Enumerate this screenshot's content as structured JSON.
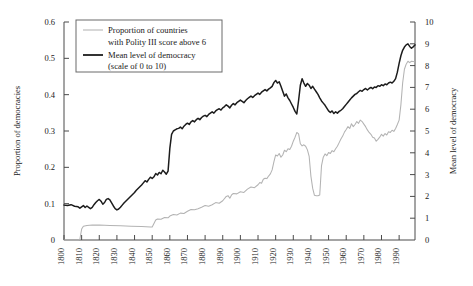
{
  "chart_data": {
    "type": "line",
    "title": "",
    "xlabel": "",
    "ylabel": "Proportion of democracies",
    "y2label": "Mean level of democracy",
    "grid": false,
    "legend_position": "top-left",
    "xlim": [
      1800,
      1999
    ],
    "ylim": [
      0,
      0.6
    ],
    "y2lim": [
      0,
      10
    ],
    "xticks": [
      1800,
      1810,
      1820,
      1830,
      1840,
      1850,
      1860,
      1870,
      1880,
      1890,
      1900,
      1910,
      1920,
      1930,
      1940,
      1950,
      1960,
      1970,
      1980,
      1990
    ],
    "xtick_labels": [
      "1800",
      "1810",
      "1820",
      "1830",
      "1840",
      "1850",
      "1860",
      "1870",
      "1880",
      "1890",
      "1900",
      "1910",
      "1920",
      "1930",
      "1940",
      "1950",
      "1960",
      "1970",
      "1980",
      "1990"
    ],
    "yticks": [
      0,
      0.1,
      0.2,
      0.3,
      0.4,
      0.5,
      0.6
    ],
    "ytick_labels": [
      "0",
      "0.1",
      "0.2",
      "0.3",
      "0.4",
      "0.5",
      "0.6"
    ],
    "y2ticks": [
      0,
      1,
      2,
      3,
      4,
      5,
      6,
      7,
      8,
      9,
      10
    ],
    "y2tick_labels": [
      "0",
      "1",
      "2",
      "3",
      "4",
      "5",
      "6",
      "7",
      "8",
      "9",
      "10"
    ],
    "series": [
      {
        "name": "Proportion of countries with Polity III score above 6",
        "axis": "left",
        "color": "#b3b3b3",
        "x": [
          1800,
          1802,
          1804,
          1806,
          1808,
          1809,
          1810,
          1811,
          1813,
          1816,
          1820,
          1824,
          1828,
          1832,
          1836,
          1840,
          1844,
          1848,
          1849,
          1850,
          1851,
          1852,
          1853,
          1854,
          1855,
          1856,
          1857,
          1858,
          1859,
          1860,
          1861,
          1862,
          1864,
          1866,
          1868,
          1870,
          1872,
          1874,
          1876,
          1878,
          1880,
          1882,
          1884,
          1886,
          1888,
          1890,
          1892,
          1894,
          1896,
          1898,
          1900,
          1902,
          1904,
          1906,
          1908,
          1910,
          1912,
          1914,
          1916,
          1918,
          1919,
          1920,
          1921,
          1922,
          1924,
          1926,
          1928,
          1930,
          1931,
          1932,
          1933,
          1934,
          1935,
          1936,
          1937,
          1938,
          1939,
          1940,
          1941,
          1942,
          1943,
          1944,
          1945,
          1946,
          1947,
          1948,
          1950,
          1952,
          1954,
          1956,
          1958,
          1960,
          1962,
          1964,
          1966,
          1968,
          1970,
          1972,
          1974,
          1976,
          1978,
          1980,
          1982,
          1984,
          1986,
          1988,
          1989,
          1990,
          1991,
          1992,
          1993,
          1994,
          1996,
          1998,
          1999
        ],
        "y": [
          0.0,
          0.0,
          0.0,
          0.0,
          0.0,
          0.0,
          0.012,
          0.036,
          0.04,
          0.041,
          0.041,
          0.04,
          0.04,
          0.039,
          0.038,
          0.037,
          0.036,
          0.036,
          0.035,
          0.035,
          0.035,
          0.034,
          0.034,
          0.034,
          0.033,
          0.033,
          0.033,
          0.033,
          0.032,
          0.032,
          0.032,
          0.031,
          0.031,
          0.031,
          0.03,
          0.03,
          0.03,
          0.029,
          0.029,
          0.029,
          0.029,
          0.028,
          0.028,
          0.028,
          0.027,
          0.027,
          0.027,
          0.027,
          0.026,
          0.026,
          0.026,
          0.026,
          0.026,
          0.026,
          0.025,
          0.025,
          0.025,
          0.025,
          0.025,
          0.025,
          0.025,
          0.025,
          0.025,
          0.025,
          0.025,
          0.025,
          0.025,
          0.025,
          0.025,
          0.025,
          0.025,
          0.025,
          0.025,
          0.025,
          0.025,
          0.025,
          0.025,
          0.025,
          0.025,
          0.025,
          0.025,
          0.025,
          0.025,
          0.025,
          0.025,
          0.025,
          0.025,
          0.025,
          0.025,
          0.025,
          0.025,
          0.025,
          0.025,
          0.025,
          0.025,
          0.025,
          0.025,
          0.025,
          0.025,
          0.025,
          0.025,
          0.025,
          0.025,
          0.025,
          0.025,
          0.025,
          0.025,
          0.025,
          0.025,
          0.025,
          0.025,
          0.025,
          0.025,
          0.025,
          0.025
        ],
        "note_shape": "flat near zero until 1810, small step to ~0.04, then slow decline and stepped rise; peak ~0.39 in 1922, deep trough ~0.12 in 1942, recovery to ~0.34 in 1960s, dip to ~0.27 in 1977, sharp rise to ~0.49 by 1995"
      },
      {
        "name": "Mean level of democracy (scale of 0 to 10)",
        "axis": "right",
        "color": "#1c1c1c",
        "note_shape": "starts ~1.6 in 1800, wobbles 1.4-1.9 to 1845, sharp jump to ~4.6 by 1852, steady rise to ~7.2 by 1920, dip to ~5.5 in 1925, rebound to ~7.5 in 1930, decline to ~5.3 in 1942, rise to ~6.9 in 1960, dip ~6.0 in 1977, rise to ~9.0 by 1995"
      }
    ],
    "legend": [
      {
        "label_line1": "Proportion of countries",
        "label_line2": "with Polity III score above 6",
        "style": "thin-gray"
      },
      {
        "label_line1": "Mean level of democracy",
        "label_line2": "(scale of 0 to 10)",
        "style": "thick-black"
      }
    ],
    "colors": {
      "dark_series": "#1c1c1c",
      "light_series": "#b3b3b3",
      "axis": "#4a4a4a",
      "background": "#ffffff"
    }
  }
}
